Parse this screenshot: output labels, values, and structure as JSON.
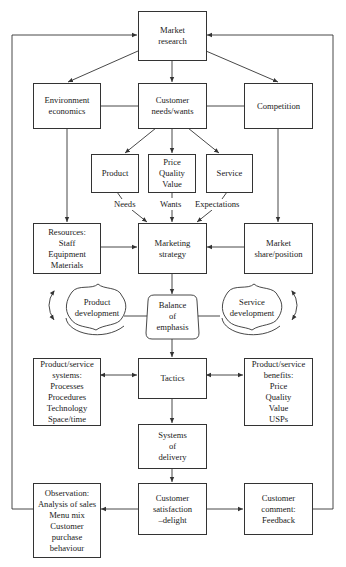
{
  "diagram": {
    "nodes": {
      "market_research": {
        "lines": [
          "Market",
          "research"
        ]
      },
      "environment": {
        "lines": [
          "Environment",
          "economics"
        ]
      },
      "customer_needs": {
        "lines": [
          "Customer",
          "needs/wants"
        ]
      },
      "competition": {
        "lines": [
          "Competition"
        ]
      },
      "product": {
        "lines": [
          "Product"
        ]
      },
      "price": {
        "lines": [
          "Price",
          "Quality",
          "Value"
        ]
      },
      "service": {
        "lines": [
          "Service"
        ]
      },
      "resources": {
        "lines": [
          "Resources:",
          "Staff",
          "Equipment",
          "Materials"
        ]
      },
      "marketing_strategy": {
        "lines": [
          "Marketing",
          "strategy"
        ]
      },
      "market_share": {
        "lines": [
          "Market",
          "share/position"
        ]
      },
      "product_development": {
        "lines": [
          "Product",
          "development"
        ]
      },
      "balance": {
        "lines": [
          "Balance",
          "of",
          "emphasis"
        ]
      },
      "service_development": {
        "lines": [
          "Service",
          "development"
        ]
      },
      "ps_systems": {
        "lines": [
          "Product/service",
          "systems:",
          "Processes",
          "Procedures",
          "Technology",
          "Space/time"
        ]
      },
      "tactics": {
        "lines": [
          "Tactics"
        ]
      },
      "ps_benefits": {
        "lines": [
          "Product/service",
          "benefits:",
          "Price",
          "Quality",
          "Value",
          "USPs"
        ]
      },
      "delivery": {
        "lines": [
          "Systems",
          "of",
          "delivery"
        ]
      },
      "observation": {
        "lines": [
          "Observation:",
          "Analysis of sales",
          "Menu mix",
          "Customer",
          "purchase",
          "behaviour"
        ]
      },
      "satisfaction": {
        "lines": [
          "Customer",
          "satisfaction",
          "–delight"
        ]
      },
      "comment": {
        "lines": [
          "Customer",
          "comment:",
          "Feedback"
        ]
      }
    },
    "edge_labels": {
      "needs": "Needs",
      "wants": "Wants",
      "expectations": "Expectations"
    },
    "colors": {
      "line": "#333333",
      "background": "#ffffff",
      "text": "#1a1a1a"
    }
  }
}
